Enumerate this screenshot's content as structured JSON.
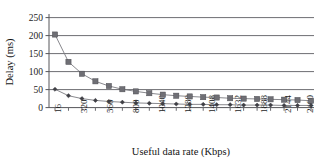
{
  "chart_data": {
    "type": "line",
    "title": "",
    "xlabel": "Useful data rate (Kbps)",
    "ylabel": "Delay (ms)",
    "ylim": [
      0,
      250
    ],
    "yticks": [
      0,
      50,
      100,
      150,
      200,
      250
    ],
    "grid": true,
    "legend": "none",
    "categories": [
      16,
      176,
      320,
      432,
      560,
      688,
      800,
      928,
      1040,
      1168,
      1280,
      1408,
      1504,
      1632,
      1760,
      1888,
      2016,
      2144,
      2272,
      2400
    ],
    "xtick_labels": [
      "16",
      "320",
      "560",
      "800",
      "1040",
      "1280",
      "1408",
      "1632",
      "1888",
      "2144",
      "2400"
    ],
    "series": [
      {
        "name": "series-squares",
        "marker": "square",
        "color": "#6f6f75",
        "values": [
          203,
          127,
          94,
          73,
          60,
          51,
          45,
          40,
          36,
          33,
          31,
          29,
          28,
          26,
          25,
          24,
          23,
          22,
          21,
          19
        ]
      },
      {
        "name": "series-diamonds",
        "marker": "diamond",
        "color": "#3f3f45",
        "values": [
          51,
          33,
          25,
          20,
          17,
          15,
          13,
          12,
          11,
          10,
          9,
          9,
          8,
          8,
          7,
          7,
          7,
          6,
          6,
          6
        ]
      }
    ]
  },
  "labels": {
    "y_axis_title": "Delay (ms)",
    "x_axis_title": "Useful data rate (Kbps)",
    "y_0": "0",
    "y_50": "50",
    "y_100": "100",
    "y_150": "150",
    "y_200": "200",
    "y_250": "250",
    "x_1": "16",
    "x_2": "320",
    "x_3": "560",
    "x_4": "800",
    "x_5": "1040",
    "x_6": "1280",
    "x_7": "1408",
    "x_8": "1632",
    "x_9": "1888",
    "x_10": "2144",
    "x_11": "2400"
  }
}
